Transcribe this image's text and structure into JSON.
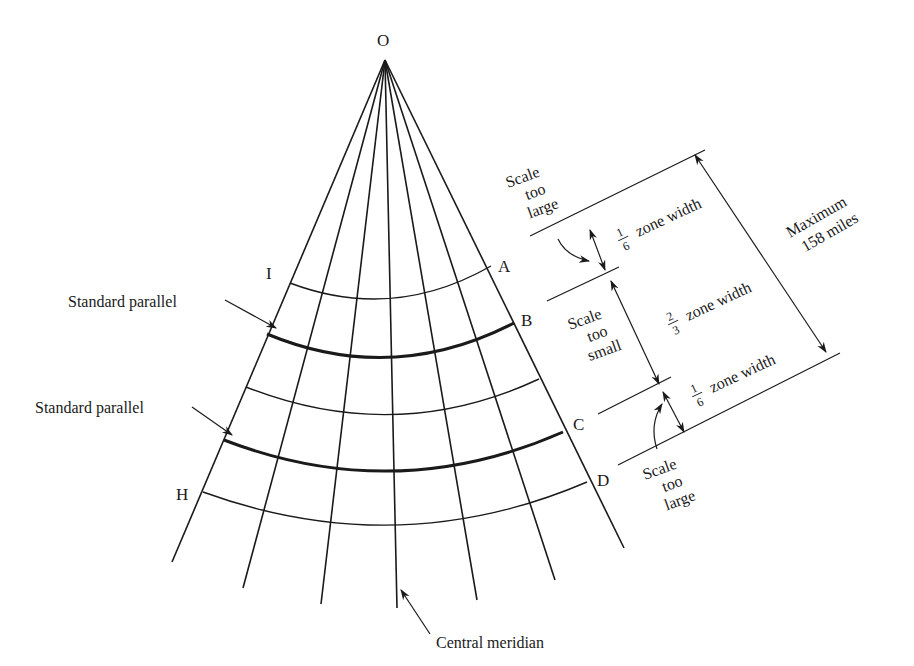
{
  "figure": {
    "apex_label": "O",
    "point_labels": {
      "I": "I",
      "A": "A",
      "B": "B",
      "C": "C",
      "D": "D",
      "H": "H"
    },
    "callouts": {
      "standard_parallel_top": "Standard parallel",
      "standard_parallel_bottom": "Standard parallel",
      "central_meridian": "Central meridian"
    },
    "scale_notes": {
      "top_large": [
        "Scale",
        "too",
        "large"
      ],
      "middle_small": [
        "Scale",
        "too",
        "small"
      ],
      "bottom_large": [
        "Scale",
        "too",
        "large"
      ]
    },
    "zone_widths": {
      "top": {
        "num": "1",
        "den": "6",
        "text": "zone width"
      },
      "middle": {
        "num": "2",
        "den": "3",
        "text": "zone width"
      },
      "bottom": {
        "num": "1",
        "den": "6",
        "text": "zone width"
      }
    },
    "maximum": [
      "Maximum",
      "158 miles"
    ],
    "colors": {
      "ink": "#1a1a1a",
      "background": "#ffffff"
    }
  }
}
